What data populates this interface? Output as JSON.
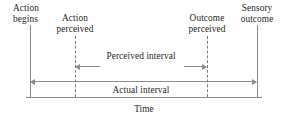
{
  "figure": {
    "type": "timeline-diagram",
    "axis_label": "Time"
  },
  "events": [
    {
      "id": "action-begins",
      "label_line1": "Action",
      "label_line2": "begins",
      "x": 30,
      "marker": "solid",
      "align": "left"
    },
    {
      "id": "action-perceived",
      "label_line1": "Action",
      "label_line2": "perceived",
      "x": 75,
      "marker": "dashed",
      "align": "center"
    },
    {
      "id": "outcome-perceived",
      "label_line1": "Outcome",
      "label_line2": "perceived",
      "x": 207,
      "marker": "dashed",
      "align": "center"
    },
    {
      "id": "sensory-outcome",
      "label_line1": "Sensory",
      "label_line2": "outcome",
      "x": 257,
      "marker": "solid",
      "align": "center"
    }
  ],
  "intervals": [
    {
      "id": "perceived-interval",
      "label": "Perceived interval",
      "from": "action-perceived",
      "to": "outcome-perceived",
      "arrows": "both"
    },
    {
      "id": "actual-interval",
      "label": "Actual interval",
      "from": "action-begins",
      "to": "sensory-outcome",
      "arrows": "both"
    }
  ],
  "labels": {
    "action_begins_l1": "Action",
    "action_begins_l2": "begins",
    "action_perceived_l1": "Action",
    "action_perceived_l2": "perceived",
    "outcome_perceived_l1": "Outcome",
    "outcome_perceived_l2": "perceived",
    "sensory_outcome_l1": "Sensory",
    "sensory_outcome_l2": "outcome",
    "perceived_interval": "Perceived interval",
    "actual_interval": "Actual interval",
    "time": "Time"
  },
  "colors": {
    "text": "#231f20",
    "line": "#8b8b8b",
    "dash": "#7d7d7d",
    "background": "#ffffff"
  }
}
